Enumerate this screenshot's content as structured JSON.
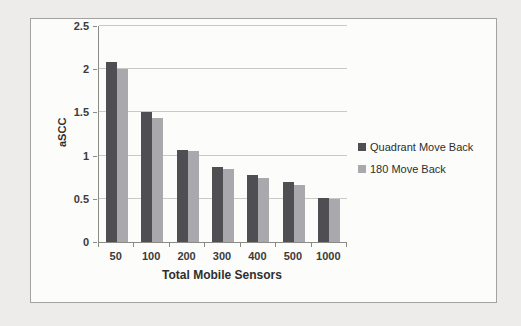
{
  "page": {
    "background_color": "#edecea"
  },
  "chart": {
    "frame_border_color": "#a3a29e",
    "frame_background_color": "#fcfcfb",
    "axis_color": "#8a8a86",
    "gridline_color": "#c9c9c5",
    "text_color": "#3b3b39"
  },
  "chart_data": {
    "type": "bar",
    "title": "",
    "xlabel": "Total Mobile Sensors",
    "ylabel": "aSCC",
    "categories": [
      "50",
      "100",
      "200",
      "300",
      "400",
      "500",
      "1000"
    ],
    "series": [
      {
        "name": "Quadrant Move Back",
        "color": "#4f4f53",
        "values": [
          2.08,
          1.5,
          1.07,
          0.87,
          0.77,
          0.7,
          0.51
        ]
      },
      {
        "name": "180 Move Back",
        "color": "#a9a9ad",
        "values": [
          2.0,
          1.44,
          1.05,
          0.85,
          0.74,
          0.66,
          0.5
        ]
      }
    ],
    "ylim": [
      0,
      2.5
    ],
    "ytick_step": 0.5,
    "yticks": [
      "0",
      "0.5",
      "1",
      "1.5",
      "2",
      "2.5"
    ],
    "grid": "horizontal",
    "legend_position": "right"
  }
}
